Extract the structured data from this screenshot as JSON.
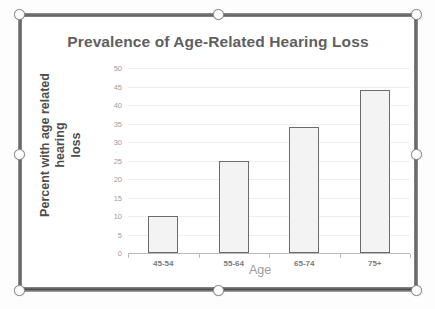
{
  "chart_data": {
    "type": "bar",
    "title": "Prevalence of Age-Related Hearing Loss",
    "xlabel": "Age",
    "ylabel": "Percent with age related hearing loss",
    "categories": [
      "45-54",
      "55-64",
      "65-74",
      "75+"
    ],
    "values": [
      10,
      25,
      34,
      44
    ],
    "ylim": [
      0,
      50
    ],
    "ytick_step": 5,
    "yticks": [
      0,
      5,
      10,
      15,
      20,
      25,
      30,
      35,
      40,
      45,
      50
    ],
    "ytick_labels": [
      "0",
      "5",
      "10",
      "15",
      "20",
      "25",
      "30",
      "35",
      "40",
      "45",
      "50"
    ],
    "grid": true,
    "legend": false,
    "colors": {
      "bar_fill": "#f3f3f3",
      "bar_outline": "#6b6b6b",
      "gridline": "#efefef",
      "title_text": "#5f5f5f",
      "axis_text": "#9d9d9d",
      "ylabel_text": "#4e4e4e",
      "xlabel_text": "#9b9b9b",
      "plot_background": "#ffffff"
    }
  },
  "ylabel_lines": {
    "line1": "Percent with age related hearing",
    "line2": "loss"
  },
  "selection": {
    "handles": [
      "resize-handle-top-left",
      "resize-handle-top-center",
      "resize-handle-top-right",
      "resize-handle-middle-left",
      "resize-handle-middle-right",
      "resize-handle-bottom-left",
      "resize-handle-bottom-center",
      "resize-handle-bottom-right"
    ]
  }
}
